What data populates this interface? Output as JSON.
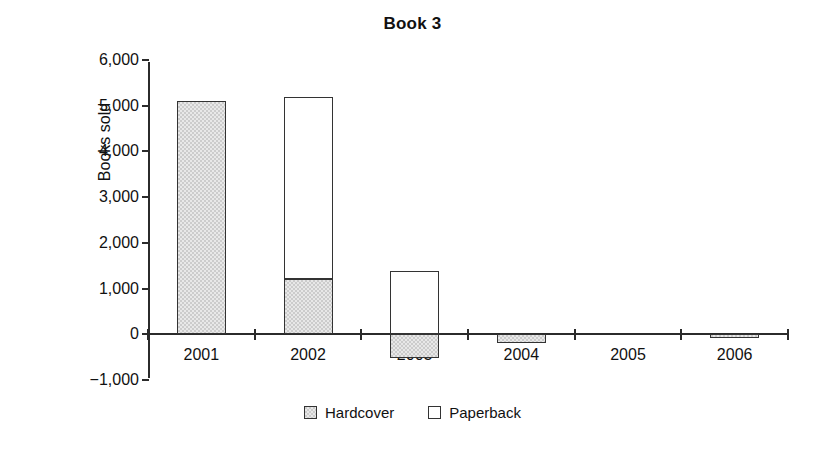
{
  "chart_data": {
    "type": "bar",
    "subtype": "stacked-column",
    "title": "Book 3",
    "xlabel": "",
    "ylabel": "Books sold",
    "categories": [
      "2001",
      "2002",
      "2003",
      "2004",
      "2005",
      "2006"
    ],
    "series": [
      {
        "name": "Hardcover",
        "color": "#cccccc",
        "values": [
          5100,
          1200,
          -520,
          -180,
          0,
          -80
        ]
      },
      {
        "name": "Paperback",
        "color": "#ffffff",
        "values": [
          0,
          4000,
          1380,
          0,
          0,
          0
        ]
      }
    ],
    "ylim": [
      -1000,
      6000
    ],
    "ytick_values": [
      6000,
      5000,
      4000,
      3000,
      2000,
      1000,
      0,
      -1000
    ],
    "ytick_labels": [
      "6,000",
      "5,000",
      "4,000",
      "3,000",
      "2,000",
      "1,000",
      "0",
      "−1,000"
    ],
    "grid": false,
    "legend_position": "bottom",
    "legend_entries": [
      "Hardcover",
      "Paperback"
    ]
  }
}
